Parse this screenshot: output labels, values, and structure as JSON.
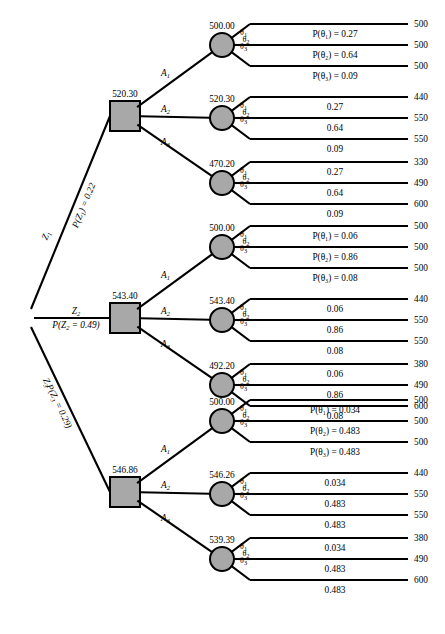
{
  "diagram": {
    "type": "decision-tree",
    "root_label": "chance-root"
  },
  "chart_data": {
    "type": "table",
    "xlabel": "",
    "ylabel": "",
    "categories": [
      "Z1",
      "Z2",
      "Z3"
    ],
    "values": [
      520.3,
      543.4,
      546.86
    ]
  },
  "info_states": [
    {
      "name": "Z1",
      "name_base": "Z",
      "name_sub": "1",
      "prob_text": "P(Z",
      "prob_sub": "1",
      "prob_tail": ") = 0.22",
      "prob_value": "0.22",
      "decision_value": "520.30",
      "actions": [
        {
          "label_base": "A",
          "label_sub": "1",
          "value": "500.00",
          "prob_labels": [
            "P(θ₁) = 0.27",
            "P(θ₂) = 0.64",
            "P(θ₃) = 0.09"
          ],
          "probs": [
            "0.27",
            "0.64",
            "0.09"
          ],
          "payoffs": [
            "500",
            "500",
            "500"
          ]
        },
        {
          "label_base": "A",
          "label_sub": "2",
          "value": "520.30",
          "prob_labels": [
            "0.27",
            "0.64",
            "0.09"
          ],
          "probs": [
            "0.27",
            "0.64",
            "0.09"
          ],
          "payoffs": [
            "440",
            "550",
            "550"
          ]
        },
        {
          "label_base": "A",
          "label_sub": "3",
          "value": "470.20",
          "prob_labels": [
            "0.27",
            "0.64",
            "0.09"
          ],
          "probs": [
            "0.27",
            "0.64",
            "0.09"
          ],
          "payoffs": [
            "330",
            "490",
            "600"
          ]
        }
      ]
    },
    {
      "name": "Z2",
      "name_base": "Z",
      "name_sub": "2",
      "prob_text": "P(Z",
      "prob_sub": "2",
      "prob_tail": " = 0.49)",
      "prob_value": "0.49",
      "decision_value": "543.40",
      "actions": [
        {
          "label_base": "A",
          "label_sub": "1",
          "value": "500.00",
          "prob_labels": [
            "P(θ₁) = 0.06",
            "P(θ₂) = 0.86",
            "P(θ₃) = 0.08"
          ],
          "probs": [
            "0.06",
            "0.86",
            "0.08"
          ],
          "payoffs": [
            "500",
            "500",
            "500"
          ]
        },
        {
          "label_base": "A",
          "label_sub": "2",
          "value": "543.40",
          "prob_labels": [
            "0.06",
            "0.86",
            "0.08"
          ],
          "probs": [
            "0.06",
            "0.86",
            "0.08"
          ],
          "payoffs": [
            "440",
            "550",
            "550"
          ]
        },
        {
          "label_base": "A",
          "label_sub": "3",
          "value": "492.20",
          "prob_labels": [
            "0.06",
            "0.86",
            "0.08"
          ],
          "probs": [
            "0.06",
            "0.86",
            "0.08"
          ],
          "payoffs": [
            "380",
            "490",
            "600"
          ]
        }
      ]
    },
    {
      "name": "Z3",
      "name_base": "Z",
      "name_sub": "3",
      "prob_text": "P(Z",
      "prob_sub": "3",
      "prob_tail": " = 0.29)",
      "prob_value": "0.29",
      "decision_value": "546.86",
      "actions": [
        {
          "label_base": "A",
          "label_sub": "1",
          "value": "500.00",
          "prob_labels": [
            "P(θ₁) = 0.034",
            "P(θ₂) = 0.483",
            "P(θ₃) = 0.483"
          ],
          "probs": [
            "0.034",
            "0.483",
            "0.483"
          ],
          "payoffs": [
            "500",
            "500",
            "500"
          ]
        },
        {
          "label_base": "A",
          "label_sub": "2",
          "value": "546.26",
          "prob_labels": [
            "0.034",
            "0.483",
            "0.483"
          ],
          "probs": [
            "0.034",
            "0.483",
            "0.483"
          ],
          "payoffs": [
            "440",
            "550",
            "550"
          ]
        },
        {
          "label_base": "A",
          "label_sub": "3",
          "value": "539.39",
          "prob_labels": [
            "0.034",
            "0.483",
            "0.483"
          ],
          "probs": [
            "0.034",
            "0.483",
            "0.483"
          ],
          "payoffs": [
            "380",
            "490",
            "600"
          ]
        }
      ]
    }
  ],
  "theta": {
    "base": "θ",
    "subs": [
      "1",
      "2",
      "3"
    ]
  },
  "colors": {
    "node_fill": "#a8a8a8",
    "stroke": "#000000",
    "background": "#ffffff"
  }
}
